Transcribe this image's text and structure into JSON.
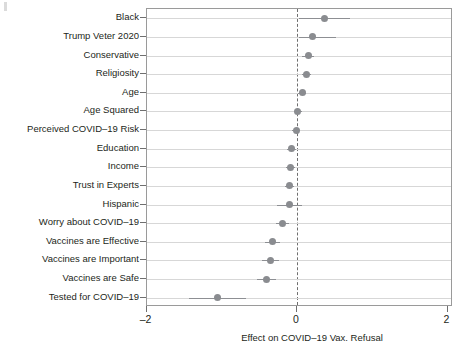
{
  "chart_data": {
    "type": "scatter",
    "subtype": "coefficient-plot-with-error-bars",
    "title": "",
    "xlabel": "Effect on COVID–19 Vax. Refusal",
    "ylabel": "",
    "xlim": [
      -2.2,
      2.1
    ],
    "xticks": [
      -2,
      0,
      2
    ],
    "xticklabels": [
      "–2",
      "0",
      "2"
    ],
    "grid": "horizontal",
    "reference_line": {
      "value": 0,
      "style": "dashed",
      "color": "#6f6f6f"
    },
    "point_color": "#8a8c90",
    "error_bar_color": "#8d8f93",
    "categories": [
      "Black",
      "Trump Veter 2020",
      "Conservative",
      "Religiosity",
      "Age",
      "Age Squared",
      "Perceived COVID–19 Risk",
      "Education",
      "Income",
      "Trust in Experts",
      "Hispanic",
      "Worry about COVID–19",
      "Vaccines are Effective",
      "Vaccines are Important",
      "Vaccines are Safe",
      "Tested for COVID–19"
    ],
    "values": [
      0.36,
      0.2,
      0.15,
      0.13,
      0.07,
      0.01,
      -0.01,
      -0.07,
      -0.09,
      -0.1,
      -0.1,
      -0.19,
      -0.32,
      -0.35,
      -0.41,
      -1.06
    ],
    "ci_low": [
      0.03,
      0.03,
      0.07,
      0.06,
      0.01,
      -0.04,
      -0.06,
      -0.13,
      -0.15,
      -0.16,
      -0.26,
      -0.28,
      -0.42,
      -0.46,
      -0.53,
      -1.44
    ],
    "ci_high": [
      0.7,
      0.52,
      0.22,
      0.19,
      0.12,
      0.06,
      0.04,
      -0.01,
      -0.03,
      -0.04,
      0.06,
      -0.1,
      -0.22,
      -0.24,
      -0.28,
      -0.68
    ]
  },
  "axis": {
    "xlabel": "Effect on COVID–19 Vax. Refusal"
  }
}
